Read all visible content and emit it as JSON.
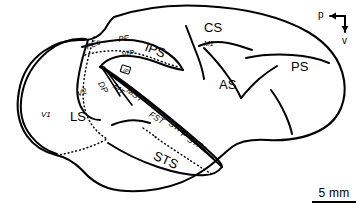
{
  "figure": {
    "background_color": "#ffffff",
    "line_color": "#000000",
    "shade_color": "#d2d2d2"
  },
  "labels": {
    "major": [
      {
        "id": "cs",
        "text": "CS",
        "x": 204,
        "y": 21,
        "rotate": 0
      },
      {
        "id": "ips",
        "text": "IPS",
        "x": 148,
        "y": 40,
        "rotate": 22
      },
      {
        "id": "as",
        "text": "AS",
        "x": 219,
        "y": 78,
        "rotate": 0
      },
      {
        "id": "ps",
        "text": "PS",
        "x": 291,
        "y": 60,
        "rotate": 0
      },
      {
        "id": "ls",
        "text": "LS",
        "x": 70,
        "y": 110,
        "rotate": 0
      },
      {
        "id": "sts",
        "text": "STS",
        "x": 157,
        "y": 149,
        "rotate": 24
      }
    ],
    "minor": [
      {
        "id": "pec",
        "text": "PEc",
        "x": 85,
        "y": 44,
        "rotate": -22
      },
      {
        "id": "pe",
        "text": "PE",
        "x": 118,
        "y": 36,
        "rotate": -8
      },
      {
        "id": "m1",
        "text": "M1",
        "x": 204,
        "y": 40,
        "rotate": 0
      },
      {
        "id": "v1",
        "text": "V1",
        "x": 41,
        "y": 111,
        "rotate": 0
      },
      {
        "id": "v2",
        "text": "V2",
        "x": 76,
        "y": 91,
        "rotate": -22
      },
      {
        "id": "vip",
        "text": "VIP",
        "x": 121,
        "y": 55,
        "rotate": -8
      },
      {
        "id": "lip",
        "text": "LIP",
        "x": 125,
        "y": 71,
        "rotate": 18
      },
      {
        "id": "dp",
        "text": "DP",
        "x": 107,
        "y": 84,
        "rotate": 62
      },
      {
        "id": "mt",
        "text": "MT",
        "x": 122,
        "y": 86,
        "rotate": 44
      },
      {
        "id": "mst",
        "text": "MST",
        "x": 137,
        "y": 90,
        "rotate": 34
      },
      {
        "id": "fst",
        "text": "FST",
        "x": 160,
        "y": 116,
        "rotate": 30
      },
      {
        "id": "stpp",
        "text": "STPp",
        "x": 184,
        "y": 126,
        "rotate": 32
      },
      {
        "id": "stpa",
        "text": "STPa",
        "x": 202,
        "y": 141,
        "rotate": 28
      }
    ]
  },
  "compass": {
    "posterior_label": "p",
    "ventral_label": "v"
  },
  "scalebar": {
    "text": "5 mm"
  }
}
